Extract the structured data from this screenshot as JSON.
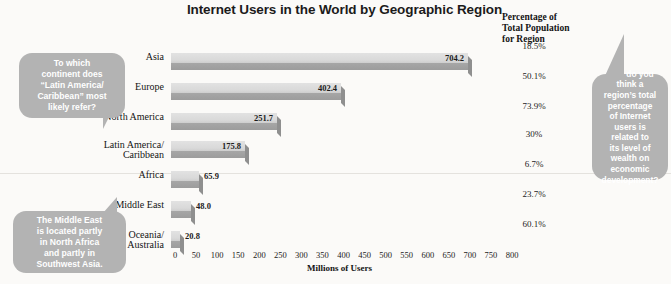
{
  "chart_data": {
    "type": "bar",
    "orientation": "horizontal",
    "title": "Internet Users in the World by Geographic Region",
    "xlabel": "Millions of Users",
    "ylabel": "",
    "xlim": [
      0,
      800
    ],
    "xticks": [
      0,
      50,
      100,
      150,
      200,
      250,
      300,
      350,
      400,
      450,
      500,
      550,
      600,
      650,
      700,
      750,
      800
    ],
    "grid": false,
    "legend": null,
    "categories": [
      "Asia",
      "Europe",
      "North America",
      "Latin America/\nCaribbean",
      "Africa",
      "Middle East",
      "Oceania/\nAustralia"
    ],
    "values": [
      704.2,
      402.4,
      251.7,
      175.8,
      65.9,
      48.0,
      20.8
    ],
    "value_labels": [
      "704.2",
      "402.4",
      "251.7",
      "175.8",
      "65.9",
      "48.0",
      "20.8"
    ],
    "secondary_column": {
      "header": "Percentage of\nTotal Population\nfor Region",
      "values": [
        "18.5%",
        "50.1%",
        "73.9%",
        "30%",
        "6.7%",
        "23.7%",
        "60.1%"
      ]
    }
  },
  "annotations": [
    {
      "name": "latin-america-question",
      "text": "To which\ncontinent does\n“Latin America/\nCaribbean” most\nlikely refer?"
    },
    {
      "name": "middle-east-note",
      "text": "The Middle East\nis located partly\nin North Africa\nand partly in\nSouthwest Asia."
    },
    {
      "name": "wealth-question",
      "text": "How do you\nthink a\nregion’s total\npercentage\nof Internet\nusers is\nrelated to\nits level of\nwealth on\neconomic\ndevelopment?"
    }
  ],
  "colors": {
    "bar_light": "#d9d9d9",
    "bar_dark": "#9c9c9c",
    "bubble": "#b3b3b3",
    "bubble_text": "#ffffff",
    "page_background": "#fbfaf8",
    "text": "#1b1b1b"
  }
}
